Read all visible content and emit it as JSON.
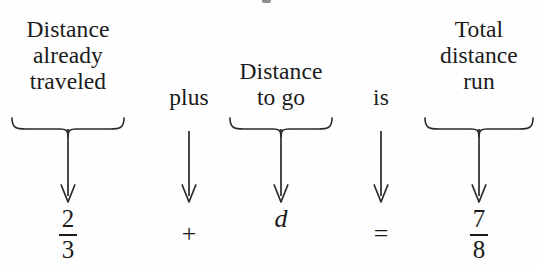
{
  "figure": {
    "kind": "word-equation-translation-diagram",
    "background_color": "#fefefe",
    "ink_color": "#1b1b1b"
  },
  "columns": [
    {
      "id": "distance-traveled",
      "role": "phrase",
      "label_lines": [
        "Distance",
        "already",
        "traveled"
      ],
      "has_brace": true,
      "arrow": "down-arrow",
      "term": {
        "kind": "fraction",
        "numerator": "2",
        "denominator": "3",
        "text": "2/3"
      }
    },
    {
      "id": "plus",
      "role": "connector",
      "label_lines": [
        "plus"
      ],
      "has_brace": false,
      "arrow": "down-arrow",
      "term": {
        "kind": "operator",
        "text": "+"
      }
    },
    {
      "id": "distance-to-go",
      "role": "phrase",
      "label_lines": [
        "Distance",
        "to go"
      ],
      "has_brace": true,
      "arrow": "down-arrow",
      "term": {
        "kind": "variable",
        "text": "d"
      }
    },
    {
      "id": "is",
      "role": "connector",
      "label_lines": [
        "is"
      ],
      "has_brace": false,
      "arrow": "down-arrow",
      "term": {
        "kind": "operator",
        "text": "="
      }
    },
    {
      "id": "total-distance-run",
      "role": "phrase",
      "label_lines": [
        "Total",
        "distance",
        "run"
      ],
      "has_brace": true,
      "arrow": "down-arrow",
      "term": {
        "kind": "fraction",
        "numerator": "7",
        "denominator": "8",
        "text": "7/8"
      }
    }
  ],
  "equation": {
    "text": "2/3 + d = 7/8"
  }
}
